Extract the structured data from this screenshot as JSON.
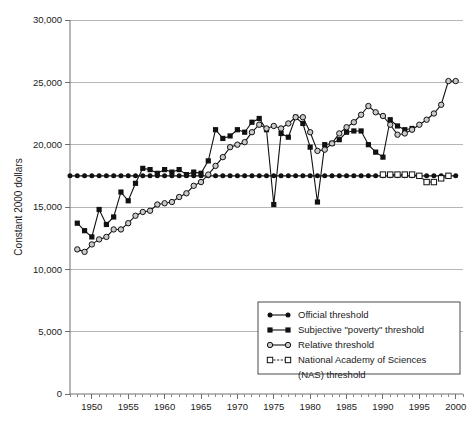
{
  "chart_data": {
    "type": "line",
    "title": "",
    "xlabel": "",
    "ylabel": "Constant 2000 dollars",
    "xlim": [
      1947,
      2001
    ],
    "ylim": [
      0,
      30000
    ],
    "grid": true,
    "legend_position": "bottom-right",
    "y_ticks": [
      0,
      5000,
      10000,
      15000,
      20000,
      25000,
      30000
    ],
    "y_tick_labels": [
      "0",
      "5,000",
      "10,000",
      "15,000",
      "20,000",
      "25,000",
      "30,000"
    ],
    "x_ticks": [
      1950,
      1955,
      1960,
      1965,
      1970,
      1975,
      1980,
      1985,
      1990,
      1995,
      2000
    ],
    "x_tick_labels": [
      "1950",
      "1955",
      "1960",
      "1965",
      "1970",
      "1975",
      "1980",
      "1985",
      "1990",
      "1995",
      "2000"
    ],
    "x_minor_tick_step": 1,
    "series": [
      {
        "name": "Official threshold",
        "marker": "filled-circle",
        "line_style": "solid",
        "color": "#111111",
        "x": [
          1947,
          1948,
          1949,
          1950,
          1951,
          1952,
          1953,
          1954,
          1955,
          1956,
          1957,
          1958,
          1959,
          1960,
          1961,
          1962,
          1963,
          1964,
          1965,
          1966,
          1967,
          1968,
          1969,
          1970,
          1971,
          1972,
          1973,
          1974,
          1975,
          1976,
          1977,
          1978,
          1979,
          1980,
          1981,
          1982,
          1983,
          1984,
          1985,
          1986,
          1987,
          1988,
          1989,
          1990,
          1991,
          1992,
          1993,
          1994,
          1995,
          1996,
          1997,
          1998,
          1999,
          2000
        ],
        "values": [
          17500,
          17500,
          17500,
          17500,
          17500,
          17500,
          17500,
          17500,
          17500,
          17500,
          17500,
          17500,
          17500,
          17500,
          17500,
          17500,
          17500,
          17500,
          17500,
          17500,
          17500,
          17500,
          17500,
          17500,
          17500,
          17500,
          17500,
          17500,
          17500,
          17500,
          17500,
          17500,
          17500,
          17500,
          17500,
          17500,
          17500,
          17500,
          17500,
          17500,
          17500,
          17500,
          17500,
          17500,
          17500,
          17500,
          17500,
          17500,
          17500,
          17500,
          17500,
          17500,
          17500,
          17500
        ]
      },
      {
        "name": "Subjective \"poverty\" threshold",
        "marker": "filled-square",
        "line_style": "solid",
        "color": "#111111",
        "x": [
          1948,
          1949,
          1950,
          1951,
          1952,
          1953,
          1954,
          1955,
          1956,
          1957,
          1958,
          1959,
          1960,
          1961,
          1962,
          1963,
          1964,
          1965,
          1966,
          1967,
          1968,
          1969,
          1970,
          1971,
          1972,
          1973,
          1974,
          1975,
          1976,
          1977,
          1978,
          1979,
          1980,
          1981,
          1982,
          1983,
          1984,
          1985,
          1986,
          1987,
          1988,
          1989,
          1990,
          1991,
          1992,
          1993,
          1994
        ],
        "values": [
          13700,
          13100,
          12600,
          14800,
          13600,
          14200,
          16200,
          15500,
          16900,
          18100,
          18000,
          17700,
          18000,
          17800,
          18000,
          17600,
          17800,
          17700,
          18700,
          21200,
          20500,
          20700,
          21200,
          21000,
          21800,
          22100,
          21200,
          15200,
          20900,
          20600,
          22200,
          21700,
          19800,
          15400,
          20000,
          20100,
          20400,
          21000,
          21100,
          21100,
          20000,
          19400,
          19000,
          22000,
          21500,
          21200,
          21300
        ]
      },
      {
        "name": "Relative threshold",
        "marker": "open-circle",
        "line_style": "solid",
        "color": "#111111",
        "x": [
          1948,
          1949,
          1950,
          1951,
          1952,
          1953,
          1954,
          1955,
          1956,
          1957,
          1958,
          1959,
          1960,
          1961,
          1962,
          1963,
          1964,
          1965,
          1966,
          1967,
          1968,
          1969,
          1970,
          1971,
          1972,
          1973,
          1974,
          1975,
          1976,
          1977,
          1978,
          1979,
          1980,
          1981,
          1982,
          1983,
          1984,
          1985,
          1986,
          1987,
          1988,
          1989,
          1990,
          1991,
          1992,
          1993,
          1994,
          1995,
          1996,
          1997,
          1998,
          1999,
          2000
        ],
        "values": [
          11600,
          11400,
          12000,
          12400,
          12600,
          13200,
          13200,
          13700,
          14300,
          14600,
          14700,
          15200,
          15300,
          15400,
          15800,
          16100,
          16700,
          17000,
          17600,
          18300,
          19000,
          19800,
          20000,
          20200,
          21000,
          21600,
          21300,
          21500,
          21300,
          21700,
          22200,
          22200,
          21000,
          19500,
          19600,
          20100,
          20900,
          21400,
          21800,
          22400,
          23100,
          22600,
          22300,
          21600,
          20800,
          20900,
          21200,
          21600,
          22000,
          22500,
          23200,
          25100,
          25100
        ]
      },
      {
        "name": "National Academy of Sciences (NAS) threshold",
        "marker": "open-square",
        "line_style": "dashed",
        "color": "#111111",
        "x": [
          1990,
          1991,
          1992,
          1993,
          1994,
          1995,
          1996,
          1997,
          1998,
          1999
        ],
        "values": [
          17600,
          17600,
          17600,
          17600,
          17600,
          17500,
          17000,
          17000,
          17300,
          17500
        ]
      }
    ]
  },
  "legend": {
    "entries": [
      {
        "label": "Official threshold",
        "marker": "filled-circle",
        "line_style": "solid"
      },
      {
        "label": "Subjective \"poverty\" threshold",
        "marker": "filled-square",
        "line_style": "solid"
      },
      {
        "label": "Relative threshold",
        "marker": "open-circle",
        "line_style": "solid"
      },
      {
        "label": "National Academy of Sciences",
        "marker": "open-square",
        "line_style": "dashed"
      },
      {
        "label": "(NAS) threshold",
        "marker": "none",
        "line_style": "none"
      }
    ]
  }
}
